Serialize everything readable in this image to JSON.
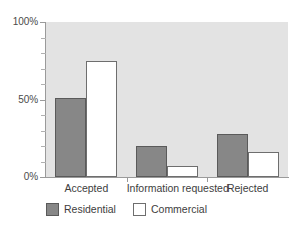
{
  "chart_data": {
    "type": "bar",
    "title": "",
    "subtitle": "",
    "xlabel": "",
    "ylabel": "",
    "categories": [
      "Accepted",
      "Information requested",
      "Rejected"
    ],
    "series": [
      {
        "name": "Residential",
        "values": [
          51,
          20,
          28
        ],
        "color": "#878787",
        "border": "#5a5a5a"
      },
      {
        "name": "Commercial",
        "values": [
          75,
          7,
          16
        ],
        "color": "#ffffff",
        "border": "#6e6e6e"
      }
    ],
    "ylim": [
      0,
      100
    ],
    "yticks": [
      0,
      50,
      100
    ],
    "ytick_labels": [
      "0%",
      "50%",
      "100%"
    ],
    "y_minor_tick_step": 10,
    "grid": false,
    "legend_position": "bottom-left",
    "plot_background": "#e3e3e3",
    "axis_color": "#9a9a9a",
    "units": "%"
  },
  "axes": {
    "y": {
      "ticks": [
        {
          "label": "100%",
          "value": 100
        },
        {
          "label": "50%",
          "value": 50
        },
        {
          "label": "0%",
          "value": 0
        }
      ]
    },
    "x": {
      "ticks": [
        {
          "label": "Accepted"
        },
        {
          "label": "Information requested"
        },
        {
          "label": "Rejected"
        }
      ]
    }
  },
  "legend": {
    "items": [
      {
        "label": "Residential",
        "swatch": "filled-gray"
      },
      {
        "label": "Commercial",
        "swatch": "outline-white"
      }
    ]
  }
}
